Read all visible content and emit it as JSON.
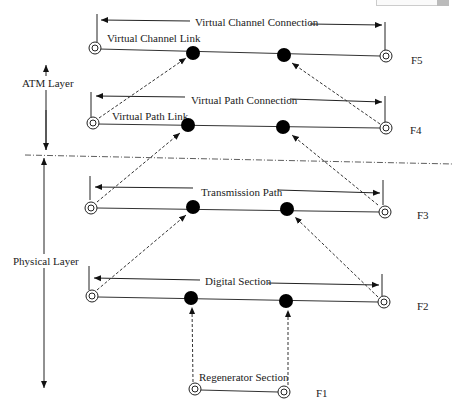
{
  "diagram": {
    "layers": [
      {
        "label": "ATM Layer"
      },
      {
        "label": "Physical Layer"
      }
    ],
    "levels": [
      {
        "id": "F5",
        "label": "F5",
        "connection": "Virtual Channel Connection",
        "link": "Virtual Channel Link"
      },
      {
        "id": "F4",
        "label": "F4",
        "connection": "Virtual Path Connection",
        "link": "Virtual Path Link"
      },
      {
        "id": "F3",
        "label": "F3",
        "connection": "Transmission Path"
      },
      {
        "id": "F2",
        "label": "F2",
        "connection": "Digital Section"
      },
      {
        "id": "F1",
        "label": "F1",
        "connection": "Regenerator Section"
      }
    ],
    "colors": {
      "line": "#333333",
      "node_fill": "#000000",
      "background": "#ffffff"
    }
  }
}
